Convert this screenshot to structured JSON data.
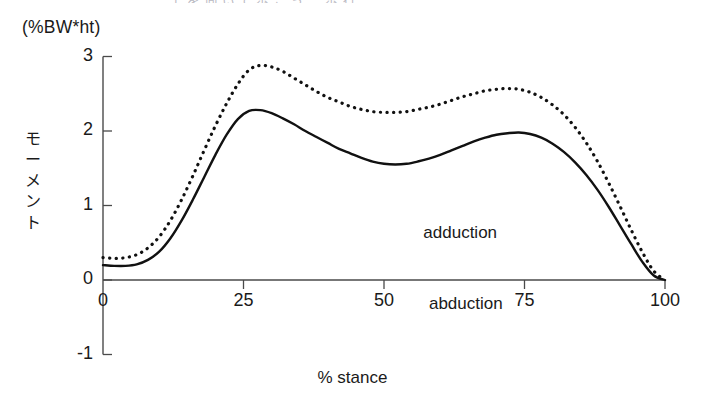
{
  "figure": {
    "partial_title": "上 を 向 い て 歩 こ う 　 歩 行",
    "unit_label": "(%BW*ht)",
    "y_axis_title_chars": [
      "モ",
      "ー",
      "メ",
      "ン",
      "ト"
    ],
    "x_axis_caption": "% stance",
    "region_upper": "adduction",
    "region_lower": "abduction"
  },
  "chart_data": {
    "type": "line",
    "title": "",
    "xlabel": "% stance",
    "ylabel": "モーメント",
    "unit": "(%BW*ht)",
    "xlim": [
      0,
      100
    ],
    "ylim": [
      -1,
      3
    ],
    "xticks": [
      0,
      25,
      50,
      75,
      100
    ],
    "yticks": [
      -1,
      0,
      1,
      2,
      3
    ],
    "xtick_labels": [
      "0",
      "25",
      "50",
      "75",
      "100"
    ],
    "ytick_labels": [
      "-1",
      "0",
      "1",
      "2",
      "3"
    ],
    "grid": false,
    "legend": "none",
    "annotations": [
      {
        "text": "adduction",
        "x": 57,
        "y": 0.62
      },
      {
        "text": "abduction",
        "x": 58,
        "y": -0.33
      }
    ],
    "series": [
      {
        "name": "solid-curve",
        "style": "solid",
        "color": "#111111",
        "x": [
          0,
          2,
          4,
          6,
          8,
          10,
          12,
          14,
          16,
          18,
          20,
          22,
          24,
          26,
          28,
          30,
          32,
          34,
          36,
          38,
          40,
          42,
          44,
          46,
          48,
          50,
          52,
          54,
          56,
          58,
          60,
          62,
          64,
          66,
          68,
          70,
          72,
          74,
          76,
          78,
          80,
          82,
          84,
          86,
          88,
          90,
          92,
          94,
          96,
          98,
          100
        ],
        "y": [
          0.2,
          0.19,
          0.19,
          0.21,
          0.27,
          0.38,
          0.56,
          0.8,
          1.08,
          1.38,
          1.68,
          1.95,
          2.16,
          2.27,
          2.28,
          2.24,
          2.17,
          2.09,
          2.0,
          1.92,
          1.84,
          1.76,
          1.7,
          1.64,
          1.59,
          1.56,
          1.55,
          1.56,
          1.59,
          1.63,
          1.68,
          1.74,
          1.8,
          1.86,
          1.91,
          1.95,
          1.97,
          1.98,
          1.96,
          1.91,
          1.83,
          1.72,
          1.58,
          1.41,
          1.21,
          0.98,
          0.73,
          0.48,
          0.24,
          0.06,
          0.0
        ]
      },
      {
        "name": "dotted-curve",
        "style": "dotted",
        "color": "#111111",
        "x": [
          0,
          2,
          4,
          6,
          8,
          10,
          12,
          14,
          16,
          18,
          20,
          22,
          24,
          26,
          28,
          30,
          32,
          34,
          36,
          38,
          40,
          42,
          44,
          46,
          48,
          50,
          52,
          54,
          56,
          58,
          60,
          62,
          64,
          66,
          68,
          70,
          72,
          74,
          76,
          78,
          80,
          82,
          84,
          86,
          88,
          90,
          92,
          94,
          96,
          98,
          100
        ],
        "y": [
          0.3,
          0.29,
          0.3,
          0.34,
          0.43,
          0.58,
          0.8,
          1.08,
          1.4,
          1.74,
          2.07,
          2.37,
          2.63,
          2.82,
          2.88,
          2.86,
          2.8,
          2.71,
          2.62,
          2.53,
          2.45,
          2.39,
          2.33,
          2.29,
          2.26,
          2.25,
          2.25,
          2.26,
          2.29,
          2.32,
          2.36,
          2.41,
          2.46,
          2.5,
          2.54,
          2.56,
          2.57,
          2.56,
          2.52,
          2.45,
          2.35,
          2.22,
          2.05,
          1.84,
          1.59,
          1.3,
          0.99,
          0.67,
          0.37,
          0.12,
          0.0
        ]
      }
    ]
  }
}
